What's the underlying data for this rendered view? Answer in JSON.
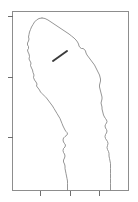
{
  "figure": {
    "background_color": "#ffffff",
    "width_px": 138,
    "height_px": 202
  },
  "chart_data": {
    "type": "line",
    "title": "",
    "xlabel": "",
    "ylabel": "",
    "grid": false,
    "legend": null,
    "axis_color": "#8d8d8d",
    "outline_color": "#7b7b7b",
    "marker_color": "#3a3a3a",
    "plot_frame": {
      "left": 12,
      "top": 11,
      "right": 128,
      "bottom": 190
    },
    "xlim": [
      12,
      128
    ],
    "ylim": [
      190,
      11
    ],
    "x_ticks": [
      40,
      70,
      99
    ],
    "x_tick_labels": [
      "",
      "",
      ""
    ],
    "y_ticks": [
      16,
      77,
      137
    ],
    "y_tick_labels": [
      "",
      "",
      ""
    ],
    "tick_length_px": 5,
    "series": [
      {
        "name": "coastline-west",
        "comment": "western (left) boundary, from northern apex down to bottom axis",
        "points": [
          [
            42,
            18
          ],
          [
            39,
            18.5
          ],
          [
            36.5,
            20
          ],
          [
            34.5,
            22
          ],
          [
            33,
            24.5
          ],
          [
            31.5,
            27
          ],
          [
            30.5,
            29.5
          ],
          [
            29.5,
            32
          ],
          [
            29,
            34.5
          ],
          [
            28.5,
            37
          ],
          [
            29,
            39
          ],
          [
            28.5,
            41
          ],
          [
            27.5,
            43
          ],
          [
            27.5,
            45
          ],
          [
            28.5,
            46.5
          ],
          [
            28.5,
            48.5
          ],
          [
            27.5,
            50
          ],
          [
            28,
            52
          ],
          [
            29,
            54
          ],
          [
            29.5,
            56.5
          ],
          [
            29,
            59
          ],
          [
            30,
            61
          ],
          [
            31,
            63
          ],
          [
            30.5,
            65.5
          ],
          [
            31.5,
            68
          ],
          [
            32.5,
            70
          ],
          [
            33,
            72.5
          ],
          [
            34,
            75
          ],
          [
            33.5,
            77.5
          ],
          [
            34.5,
            80
          ],
          [
            36,
            82
          ],
          [
            37,
            84
          ],
          [
            36.5,
            86
          ],
          [
            38,
            88
          ],
          [
            39.5,
            90
          ],
          [
            40.5,
            92
          ],
          [
            42,
            93.5
          ],
          [
            43.5,
            95
          ],
          [
            45,
            96.5
          ],
          [
            46.5,
            98
          ],
          [
            48,
            100
          ],
          [
            49.5,
            102
          ],
          [
            51,
            104
          ],
          [
            52.5,
            106
          ],
          [
            54,
            108.5
          ],
          [
            55.5,
            111
          ],
          [
            57,
            113.5
          ],
          [
            58.5,
            116
          ],
          [
            60,
            118.5
          ],
          [
            61,
            121
          ],
          [
            62,
            123.5
          ],
          [
            63,
            126
          ],
          [
            64,
            128
          ],
          [
            65,
            130
          ],
          [
            66,
            131.5
          ],
          [
            67,
            132.5
          ],
          [
            67.5,
            134
          ],
          [
            66.5,
            135.5
          ],
          [
            65,
            136.5
          ],
          [
            63.5,
            138
          ],
          [
            63,
            140
          ],
          [
            63.5,
            142
          ],
          [
            64.5,
            143.5
          ],
          [
            65.5,
            145
          ],
          [
            65,
            147
          ],
          [
            63.5,
            148.5
          ],
          [
            63,
            150.5
          ],
          [
            63.5,
            152.5
          ],
          [
            64.5,
            154
          ],
          [
            65,
            156
          ],
          [
            64.5,
            158
          ],
          [
            63.5,
            160
          ],
          [
            63.5,
            162
          ],
          [
            64.5,
            164
          ],
          [
            65,
            166
          ],
          [
            65,
            168.5
          ],
          [
            65.5,
            171
          ],
          [
            66,
            173.5
          ],
          [
            66.5,
            176
          ],
          [
            67,
            178.5
          ],
          [
            67.5,
            181
          ],
          [
            67.5,
            183.5
          ],
          [
            67.5,
            186
          ],
          [
            67.5,
            188
          ],
          [
            67.5,
            190
          ]
        ]
      },
      {
        "name": "coastline-east",
        "comment": "eastern (right) boundary, from northern apex down to bottom axis",
        "points": [
          [
            42,
            18
          ],
          [
            45,
            18.5
          ],
          [
            48,
            20
          ],
          [
            51,
            22
          ],
          [
            54,
            24
          ],
          [
            57,
            26
          ],
          [
            60,
            28
          ],
          [
            63,
            30
          ],
          [
            66,
            32
          ],
          [
            69,
            34
          ],
          [
            71.5,
            36
          ],
          [
            74,
            38
          ],
          [
            76,
            40
          ],
          [
            77.5,
            42
          ],
          [
            78.5,
            44
          ],
          [
            79,
            46
          ],
          [
            80,
            47.5
          ],
          [
            81.5,
            48.5
          ],
          [
            83,
            48.5
          ],
          [
            84.5,
            49.5
          ],
          [
            85.5,
            51
          ],
          [
            86,
            53
          ],
          [
            87,
            55
          ],
          [
            88.5,
            57
          ],
          [
            90,
            59
          ],
          [
            91.5,
            61
          ],
          [
            93,
            63
          ],
          [
            94.5,
            65
          ],
          [
            95.5,
            67
          ],
          [
            96.5,
            69
          ],
          [
            97.5,
            71
          ],
          [
            98.5,
            73
          ],
          [
            99.5,
            75
          ],
          [
            100,
            77
          ],
          [
            100.5,
            79
          ],
          [
            100.5,
            81
          ],
          [
            100,
            83
          ],
          [
            99.5,
            85
          ],
          [
            99.5,
            87
          ],
          [
            100,
            89
          ],
          [
            100.5,
            91
          ],
          [
            101,
            93
          ],
          [
            101.5,
            95
          ],
          [
            102,
            97
          ],
          [
            102,
            99
          ],
          [
            101.5,
            101
          ],
          [
            101,
            103
          ],
          [
            101.5,
            105
          ],
          [
            102,
            107
          ],
          [
            102,
            109
          ],
          [
            102.5,
            111
          ],
          [
            103,
            113
          ],
          [
            103.5,
            115
          ],
          [
            104.5,
            117
          ],
          [
            105.5,
            118.5
          ],
          [
            106.5,
            120
          ],
          [
            107,
            121.5
          ],
          [
            106.5,
            123
          ],
          [
            105.5,
            124.5
          ],
          [
            105,
            126
          ],
          [
            105.5,
            128
          ],
          [
            106.5,
            129.5
          ],
          [
            107,
            131
          ],
          [
            106.5,
            133
          ],
          [
            105.5,
            134.5
          ],
          [
            105,
            136.5
          ],
          [
            105.5,
            138.5
          ],
          [
            106.5,
            140
          ],
          [
            107.5,
            141.5
          ],
          [
            108,
            143.5
          ],
          [
            107.5,
            145.5
          ],
          [
            107,
            147.5
          ],
          [
            107.5,
            149.5
          ],
          [
            108.5,
            151.5
          ],
          [
            109,
            153.5
          ],
          [
            109,
            156
          ],
          [
            109.5,
            158.5
          ],
          [
            110,
            161
          ],
          [
            110.5,
            163.5
          ],
          [
            110.5,
            166
          ],
          [
            110.5,
            168.5
          ],
          [
            110.5,
            171
          ],
          [
            110.5,
            173.5
          ],
          [
            110.5,
            176
          ],
          [
            110.5,
            178.5
          ],
          [
            110.5,
            181
          ],
          [
            110.5,
            183.5
          ],
          [
            110.5,
            186
          ],
          [
            110.5,
            188
          ],
          [
            110.5,
            190
          ]
        ]
      }
    ],
    "annotations": [
      {
        "name": "marker-segment",
        "type": "line-segment",
        "x1": 53,
        "y1": 61,
        "x2": 67,
        "y2": 51,
        "color": "#3a3a3a",
        "linewidth": 1.9
      }
    ]
  }
}
